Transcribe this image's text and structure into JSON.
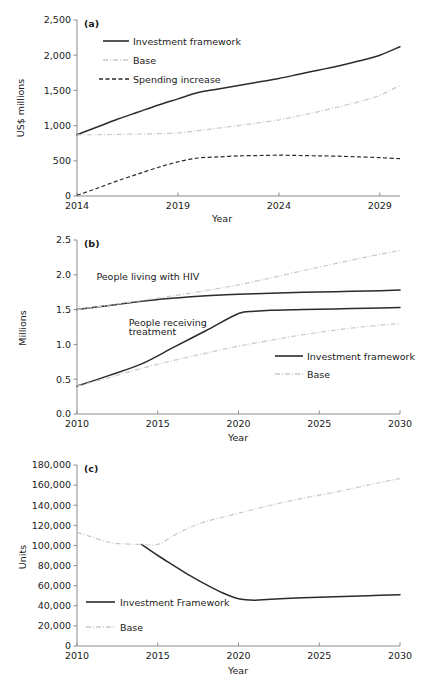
{
  "figure": {
    "panels": [
      "a",
      "b",
      "c"
    ]
  },
  "chart_data": [
    {
      "type": "line",
      "panel_tag": "(a)",
      "title": "",
      "xlabel": "Year",
      "ylabel": "US$ millions",
      "xlim": [
        2014,
        2030
      ],
      "ylim": [
        0,
        2500
      ],
      "xticks": [
        2014,
        2019,
        2024,
        2029
      ],
      "xticklabels": [
        "2014",
        "2019",
        "2024",
        "2029"
      ],
      "yticks": [
        0,
        500,
        1000,
        1500,
        2000,
        2500
      ],
      "yticklabels": [
        "0",
        "500",
        "1,000",
        "1,500",
        "2,000",
        "2,500"
      ],
      "grid": false,
      "legend_position": "upper-left-inside",
      "series": [
        {
          "name": "Investment framework",
          "style": "solid",
          "color": "#2b2b2b",
          "x": [
            2014,
            2015,
            2016,
            2017,
            2018,
            2019,
            2020,
            2021,
            2022,
            2023,
            2024,
            2025,
            2026,
            2027,
            2028,
            2029,
            2030
          ],
          "values": [
            870,
            980,
            1090,
            1190,
            1290,
            1380,
            1470,
            1520,
            1570,
            1620,
            1670,
            1730,
            1790,
            1850,
            1920,
            2000,
            2120
          ]
        },
        {
          "name": "Base",
          "style": "dash-dot-light",
          "color": "#c9c9c9",
          "x": [
            2014,
            2015,
            2016,
            2017,
            2018,
            2019,
            2020,
            2021,
            2022,
            2023,
            2024,
            2025,
            2026,
            2027,
            2028,
            2029,
            2030
          ],
          "values": [
            870,
            870,
            875,
            880,
            885,
            895,
            930,
            965,
            1000,
            1040,
            1080,
            1140,
            1200,
            1270,
            1340,
            1430,
            1570
          ]
        },
        {
          "name": "Spending increase",
          "style": "dashed",
          "color": "#2b2b2b",
          "x": [
            2014,
            2015,
            2016,
            2017,
            2018,
            2019,
            2020,
            2021,
            2022,
            2023,
            2024,
            2025,
            2026,
            2027,
            2028,
            2029,
            2030
          ],
          "values": [
            10,
            110,
            215,
            310,
            405,
            485,
            540,
            555,
            570,
            575,
            580,
            575,
            570,
            565,
            555,
            545,
            530
          ]
        }
      ]
    },
    {
      "type": "line",
      "panel_tag": "(b)",
      "title": "",
      "xlabel": "Year",
      "ylabel": "Millions",
      "xlim": [
        2010,
        2030
      ],
      "ylim": [
        0.0,
        2.5
      ],
      "xticks": [
        2010,
        2015,
        2020,
        2025,
        2030
      ],
      "xticklabels": [
        "2010",
        "2015",
        "2020",
        "2025",
        "2030"
      ],
      "yticks": [
        0.0,
        0.5,
        1.0,
        1.5,
        2.0,
        2.5
      ],
      "yticklabels": [
        "0.0",
        "0.5",
        "1.0",
        "1.5",
        "2.0",
        "2.5"
      ],
      "grid": false,
      "legend_position": "lower-right-inside",
      "annotations": [
        {
          "text": "People living with HIV",
          "x": 2011.2,
          "y": 1.92
        },
        {
          "text": "People receiving",
          "x": 2013.2,
          "y": 1.27
        },
        {
          "text": "treatment",
          "x": 2013.2,
          "y": 1.13
        }
      ],
      "series": [
        {
          "name": "People living with HIV — Investment framework",
          "legend": "Investment framework",
          "style": "solid",
          "color": "#2b2b2b",
          "x": [
            2010,
            2012,
            2014,
            2015,
            2016,
            2017,
            2018,
            2020,
            2022,
            2024,
            2026,
            2028,
            2030
          ],
          "values": [
            1.5,
            1.56,
            1.62,
            1.645,
            1.665,
            1.685,
            1.7,
            1.72,
            1.735,
            1.748,
            1.758,
            1.768,
            1.78
          ]
        },
        {
          "name": "People receiving treatment — Investment framework",
          "legend": "Investment framework",
          "style": "solid",
          "color": "#2b2b2b",
          "x": [
            2010,
            2012,
            2014,
            2016,
            2018,
            2020,
            2021,
            2022,
            2024,
            2026,
            2028,
            2030
          ],
          "values": [
            0.4,
            0.555,
            0.72,
            0.96,
            1.2,
            1.445,
            1.475,
            1.49,
            1.5,
            1.51,
            1.52,
            1.53
          ]
        },
        {
          "name": "People living with HIV — Base",
          "legend": "Base",
          "style": "dash-dot-light",
          "color": "#c9c9c9",
          "x": [
            2010,
            2012,
            2014,
            2016,
            2018,
            2020,
            2022,
            2024,
            2026,
            2028,
            2030
          ],
          "values": [
            1.5,
            1.565,
            1.63,
            1.7,
            1.775,
            1.855,
            1.955,
            2.06,
            2.16,
            2.26,
            2.35
          ]
        },
        {
          "name": "People receiving treatment — Base",
          "legend": "Base",
          "style": "dash-dot-light",
          "color": "#c9c9c9",
          "x": [
            2010,
            2012,
            2014,
            2016,
            2018,
            2020,
            2022,
            2024,
            2026,
            2028,
            2030
          ],
          "values": [
            0.4,
            0.525,
            0.655,
            0.77,
            0.875,
            0.975,
            1.06,
            1.14,
            1.205,
            1.26,
            1.3
          ]
        }
      ]
    },
    {
      "type": "line",
      "panel_tag": "(c)",
      "title": "",
      "xlabel": "Year",
      "ylabel": "Units",
      "xlim": [
        2010,
        2030
      ],
      "ylim": [
        0,
        180000
      ],
      "xticks": [
        2010,
        2015,
        2020,
        2025,
        2030
      ],
      "xticklabels": [
        "2010",
        "2015",
        "2020",
        "2025",
        "2030"
      ],
      "yticks": [
        0,
        20000,
        40000,
        60000,
        80000,
        100000,
        120000,
        140000,
        160000,
        180000
      ],
      "yticklabels": [
        "0",
        "20,000",
        "40,000",
        "60,000",
        "80,000",
        "100,000",
        "120,000",
        "140,000",
        "160,000",
        "180,000"
      ],
      "grid": false,
      "legend_position": "lower-left-inside",
      "series": [
        {
          "name": "Investment Framework",
          "style": "solid",
          "color": "#2b2b2b",
          "x": [
            2014,
            2015,
            2016,
            2017,
            2018,
            2019,
            2020,
            2021,
            2022,
            2024,
            2026,
            2028,
            2030
          ],
          "values": [
            101000,
            90000,
            80000,
            70000,
            61000,
            53000,
            47000,
            45500,
            46500,
            48000,
            49000,
            50000,
            51000
          ]
        },
        {
          "name": "Base",
          "style": "dash-dot-light",
          "color": "#c9c9c9",
          "x": [
            2010,
            2011,
            2012,
            2013,
            2014,
            2015,
            2016,
            2017,
            2018,
            2019,
            2020,
            2022,
            2024,
            2026,
            2028,
            2030
          ],
          "values": [
            113000,
            108000,
            103000,
            101500,
            101000,
            101000,
            110000,
            118000,
            124000,
            128000,
            132000,
            140000,
            147000,
            153000,
            160000,
            166500
          ]
        }
      ]
    }
  ],
  "legends": {
    "a": [
      {
        "label": "Investment framework",
        "style": "solid"
      },
      {
        "label": "Base",
        "style": "dash-dot-light"
      },
      {
        "label": "Spending increase",
        "style": "dashed"
      }
    ],
    "b": [
      {
        "label": "Investment framework",
        "style": "solid"
      },
      {
        "label": "Base",
        "style": "dash-dot-light"
      }
    ],
    "c": [
      {
        "label": "Investment Framework",
        "style": "solid"
      },
      {
        "label": "Base",
        "style": "dash-dot-light"
      }
    ]
  },
  "colors": {
    "solid": "#2b2b2b",
    "base": "#c9c9c9",
    "axis": "#8c8c8c",
    "text": "#1a1a1a",
    "background": "#ffffff"
  }
}
